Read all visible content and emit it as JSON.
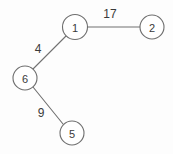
{
  "figure": {
    "kind": "weighted-graph-diagram",
    "background_color": "#fdfdfd",
    "stroke_color": "#6e6e6e",
    "text_color": "#3a3a3a",
    "width": 173,
    "height": 154
  },
  "graph": {
    "nodes": [
      {
        "id": "n1",
        "label": "1",
        "cx": 75,
        "cy": 27,
        "r": 12.5
      },
      {
        "id": "n2",
        "label": "2",
        "cx": 152,
        "cy": 27,
        "r": 12.0
      },
      {
        "id": "n6",
        "label": "6",
        "cx": 25,
        "cy": 78,
        "r": 12.0
      },
      {
        "id": "n5",
        "label": "5",
        "cx": 72,
        "cy": 133,
        "r": 12.0
      }
    ],
    "edges": [
      {
        "id": "e-1-2",
        "from": "n1",
        "to": "n2",
        "weight": "17",
        "x1": 88,
        "y1": 27,
        "x2": 140,
        "y2": 27,
        "label_x": 110,
        "label_y": 14
      },
      {
        "id": "e-1-6",
        "from": "n6",
        "to": "n1",
        "weight": "4",
        "x1": 33,
        "y1": 69,
        "x2": 66,
        "y2": 36,
        "label_x": 38,
        "label_y": 49
      },
      {
        "id": "e-6-5",
        "from": "n6",
        "to": "n5",
        "weight": "9",
        "x1": 33,
        "y1": 87,
        "x2": 63,
        "y2": 124,
        "label_x": 41,
        "label_y": 113
      }
    ]
  }
}
